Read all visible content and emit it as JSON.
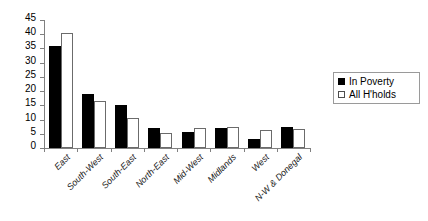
{
  "chart_data": {
    "type": "bar",
    "title": "",
    "subtitle": "",
    "xlabel": "",
    "ylabel": "",
    "ylim": [
      0,
      45
    ],
    "yticks": [
      0,
      5,
      10,
      15,
      20,
      25,
      30,
      35,
      40,
      45
    ],
    "ytick_labels": [
      "0",
      "5",
      "10",
      "15",
      "20",
      "25",
      "30",
      "35",
      "40",
      "45"
    ],
    "grid": false,
    "legend_position": "right",
    "categories": [
      "East",
      "South-West",
      "South-East",
      "North-East",
      "Mid-West",
      "Midlands",
      "West",
      "N-W & Donegal"
    ],
    "series": [
      {
        "name": "In Poverty",
        "color": "#000000",
        "style": "filled",
        "values": [
          36.0,
          19.0,
          15.0,
          7.2,
          5.6,
          6.9,
          3.2,
          7.4
        ]
      },
      {
        "name": "All H'holds",
        "color": "#ffffff",
        "style": "hollow",
        "values": [
          40.5,
          16.5,
          10.5,
          5.3,
          7.2,
          7.4,
          6.2,
          6.7
        ]
      }
    ],
    "annotations": []
  },
  "legend": {
    "entries": [
      {
        "label": "In Poverty",
        "swatch": "filled-square-icon"
      },
      {
        "label": "All H'holds",
        "swatch": "hollow-square-icon"
      }
    ]
  }
}
